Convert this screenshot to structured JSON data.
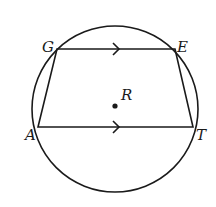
{
  "diagram": {
    "type": "inscribed-trapezoid",
    "stroke_color": "#1a1a1a",
    "circle": {
      "cx": 115,
      "cy": 109,
      "r": 83
    },
    "center": {
      "name": "R",
      "x": 115,
      "y": 106
    },
    "vertices": [
      {
        "name": "G",
        "x": 57,
        "y": 49
      },
      {
        "name": "E",
        "x": 175,
        "y": 49
      },
      {
        "name": "T",
        "x": 193,
        "y": 127
      },
      {
        "name": "A",
        "x": 38,
        "y": 127
      }
    ],
    "parallel_sides": [
      "GE",
      "AT"
    ],
    "labels": {
      "G": "G",
      "E": "E",
      "A": "A",
      "T": "T",
      "R": "R"
    }
  }
}
